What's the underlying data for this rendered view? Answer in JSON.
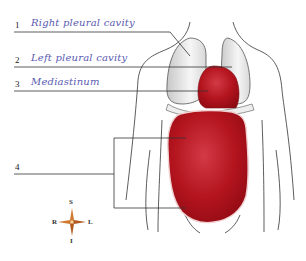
{
  "diagram": {
    "labels": [
      {
        "number": "1",
        "text": "Right pleural cavity"
      },
      {
        "number": "2",
        "text": "Left pleural cavity"
      },
      {
        "number": "3",
        "text": "Mediastinum"
      },
      {
        "number": "4",
        "text": ""
      }
    ],
    "compass": {
      "top": "S",
      "bottom": "I",
      "left": "R",
      "right": "L"
    },
    "colors": {
      "organ_red": "#b0121c",
      "pleura_gray": "#e6e6e6",
      "outline": "#333333",
      "label_text": "#5a5ab0",
      "compass": "#d07a30"
    }
  }
}
